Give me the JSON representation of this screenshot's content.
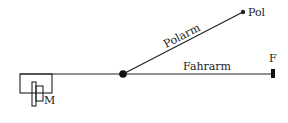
{
  "diagram": {
    "type": "planimeter-schematic",
    "labels": {
      "pole": "Pol",
      "pole_arm": "Polarm",
      "tracer_arm": "Fahrarm",
      "tracer": "F",
      "measuring_wheel": "M"
    },
    "colors": {
      "ink": "#222222",
      "background": "#ffffff"
    }
  }
}
